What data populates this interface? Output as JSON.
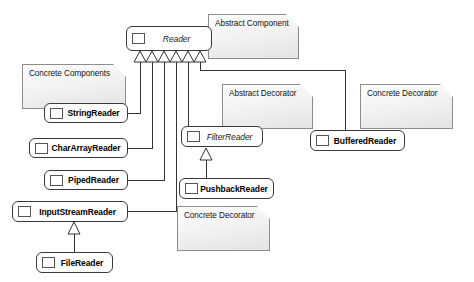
{
  "diagram": {
    "background": "#ffffff",
    "line_color": "#333333",
    "note_fill": "#eeeeee",
    "note_border": "#8d8d8d",
    "class_border": "#3a3a3a"
  },
  "classes": [
    {
      "id": "reader",
      "label": "Reader",
      "kind": "abstract",
      "x": 126,
      "y": 26,
      "w": 86,
      "h": 25
    },
    {
      "id": "stringreader",
      "label": "StringReader",
      "kind": "concrete",
      "x": 44,
      "y": 103,
      "w": 84,
      "h": 20
    },
    {
      "id": "chararrayreader",
      "label": "CharArrayReader",
      "kind": "concrete",
      "x": 29,
      "y": 138,
      "w": 99,
      "h": 20
    },
    {
      "id": "pipedreader",
      "label": "PipedReader",
      "kind": "concrete",
      "x": 44,
      "y": 170,
      "w": 84,
      "h": 20
    },
    {
      "id": "inputstreamreader",
      "label": "InputStreamReader",
      "kind": "concrete",
      "x": 12,
      "y": 201,
      "w": 116,
      "h": 21
    },
    {
      "id": "filereader",
      "label": "FileReader",
      "kind": "concrete",
      "x": 36,
      "y": 252,
      "w": 77,
      "h": 21
    },
    {
      "id": "filterreader",
      "label": "FilterReader",
      "kind": "abstract",
      "x": 181,
      "y": 126,
      "w": 82,
      "h": 21
    },
    {
      "id": "pushbackreader",
      "label": "PushbackReader",
      "kind": "concrete",
      "x": 179,
      "y": 178,
      "w": 95,
      "h": 21
    },
    {
      "id": "bufferedreader",
      "label": "BufferedReader",
      "kind": "concrete",
      "x": 310,
      "y": 130,
      "w": 95,
      "h": 21
    }
  ],
  "notes": [
    {
      "id": "note-abstract-component",
      "label": "Abstract Component",
      "x": 208,
      "y": 14,
      "w": 91,
      "h": 45
    },
    {
      "id": "note-concrete-components",
      "label": "Concrete Components",
      "x": 22,
      "y": 64,
      "w": 104,
      "h": 45
    },
    {
      "id": "note-abstract-decorator",
      "label": "Abstract Decorator",
      "x": 222,
      "y": 84,
      "w": 91,
      "h": 45
    },
    {
      "id": "note-concrete-decorator-right",
      "label": "Concrete Decorator",
      "x": 360,
      "y": 84,
      "w": 93,
      "h": 45
    },
    {
      "id": "note-concrete-decorator-bottom",
      "label": "Concrete Decorator",
      "x": 177,
      "y": 206,
      "w": 93,
      "h": 45
    }
  ],
  "relationships": [
    {
      "from": "stringreader",
      "to": "reader",
      "type": "generalization"
    },
    {
      "from": "chararrayreader",
      "to": "reader",
      "type": "generalization"
    },
    {
      "from": "pipedreader",
      "to": "reader",
      "type": "generalization"
    },
    {
      "from": "inputstreamreader",
      "to": "reader",
      "type": "generalization"
    },
    {
      "from": "filterreader",
      "to": "reader",
      "type": "generalization"
    },
    {
      "from": "bufferedreader",
      "to": "reader",
      "type": "generalization"
    },
    {
      "from": "filereader",
      "to": "inputstreamreader",
      "type": "generalization"
    },
    {
      "from": "pushbackreader",
      "to": "filterreader",
      "type": "generalization"
    }
  ]
}
